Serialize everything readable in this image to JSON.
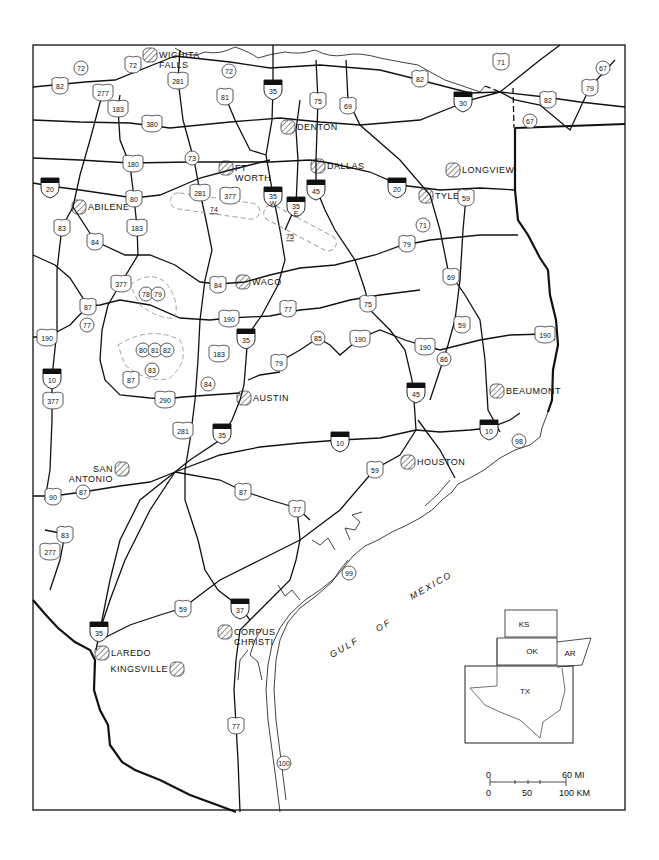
{
  "map": {
    "title": "",
    "water_label": [
      "GULF",
      "OF",
      "MEXICO"
    ],
    "cities": [
      {
        "name": "WICHITA",
        "name2": "FALLS",
        "x": 150,
        "y": 55
      },
      {
        "name": "DENTON",
        "x": 288,
        "y": 127
      },
      {
        "name": "DALLAS",
        "x": 318,
        "y": 166
      },
      {
        "name": "FT",
        "name2": "WORTH",
        "x": 226,
        "y": 168
      },
      {
        "name": "ABILENE",
        "x": 79,
        "y": 207
      },
      {
        "name": "LONGVIEW",
        "x": 453,
        "y": 170
      },
      {
        "name": "TYLER",
        "x": 426,
        "y": 196
      },
      {
        "name": "WACO",
        "x": 243,
        "y": 282
      },
      {
        "name": "AUSTIN",
        "x": 244,
        "y": 398
      },
      {
        "name": "BEAUMONT",
        "x": 497,
        "y": 391
      },
      {
        "name": "HOUSTON",
        "x": 408,
        "y": 462
      },
      {
        "name": "SAN",
        "name2": "ANTONIO",
        "x": 122,
        "y": 469
      },
      {
        "name": "CORPUS",
        "name2": "CHRISTI",
        "x": 225,
        "y": 632
      },
      {
        "name": "LAREDO",
        "x": 102,
        "y": 653
      },
      {
        "name": "KINGSVILLE",
        "x": 177,
        "y": 669
      }
    ],
    "interstates": [
      {
        "num": "35",
        "x": 273,
        "y": 88
      },
      {
        "num": "30",
        "x": 463,
        "y": 100
      },
      {
        "num": "20",
        "x": 50,
        "y": 186
      },
      {
        "num": "20",
        "x": 397,
        "y": 186
      },
      {
        "num": "35",
        "sub": "W",
        "x": 273,
        "y": 195
      },
      {
        "num": "35",
        "sub": "E",
        "x": 296,
        "y": 205
      },
      {
        "num": "45",
        "x": 316,
        "y": 188
      },
      {
        "num": "35",
        "x": 246,
        "y": 337
      },
      {
        "num": "10",
        "x": 52,
        "y": 377
      },
      {
        "num": "45",
        "x": 416,
        "y": 391
      },
      {
        "num": "35",
        "x": 222,
        "y": 432
      },
      {
        "num": "10",
        "x": 340,
        "y": 440
      },
      {
        "num": "10",
        "x": 489,
        "y": 428
      },
      {
        "num": "35",
        "x": 99,
        "y": 630
      },
      {
        "num": "37",
        "x": 240,
        "y": 607
      }
    ],
    "us_routes": [
      {
        "num": "82",
        "x": 60,
        "y": 85
      },
      {
        "num": "277",
        "x": 103,
        "y": 92
      },
      {
        "num": "72",
        "x": 133,
        "y": 64
      },
      {
        "num": "281",
        "x": 178,
        "y": 80
      },
      {
        "num": "183",
        "x": 118,
        "y": 108
      },
      {
        "num": "380",
        "x": 152,
        "y": 123
      },
      {
        "num": "81",
        "x": 225,
        "y": 96
      },
      {
        "num": "75",
        "x": 318,
        "y": 100
      },
      {
        "num": "69",
        "x": 348,
        "y": 105
      },
      {
        "num": "82",
        "x": 420,
        "y": 78
      },
      {
        "num": "71",
        "x": 501,
        "y": 61
      },
      {
        "num": "82",
        "x": 548,
        "y": 99
      },
      {
        "num": "79",
        "x": 590,
        "y": 87
      },
      {
        "num": "180",
        "x": 133,
        "y": 163
      },
      {
        "num": "80",
        "x": 134,
        "y": 198
      },
      {
        "num": "281",
        "x": 200,
        "y": 192
      },
      {
        "num": "377",
        "x": 230,
        "y": 195
      },
      {
        "num": "83",
        "x": 62,
        "y": 227
      },
      {
        "num": "84",
        "x": 95,
        "y": 241
      },
      {
        "num": "183",
        "x": 137,
        "y": 227
      },
      {
        "num": "59",
        "x": 466,
        "y": 197
      },
      {
        "num": "79",
        "x": 407,
        "y": 243
      },
      {
        "num": "69",
        "x": 451,
        "y": 276
      },
      {
        "num": "377",
        "x": 121,
        "y": 283
      },
      {
        "num": "84",
        "x": 218,
        "y": 284
      },
      {
        "num": "87",
        "x": 88,
        "y": 306
      },
      {
        "num": "77",
        "x": 288,
        "y": 308
      },
      {
        "num": "75",
        "x": 368,
        "y": 303
      },
      {
        "num": "190",
        "x": 47,
        "y": 337
      },
      {
        "num": "190",
        "x": 229,
        "y": 318
      },
      {
        "num": "59",
        "x": 462,
        "y": 324
      },
      {
        "num": "190",
        "x": 360,
        "y": 338
      },
      {
        "num": "190",
        "x": 425,
        "y": 346
      },
      {
        "num": "190",
        "x": 545,
        "y": 334
      },
      {
        "num": "183",
        "x": 219,
        "y": 353
      },
      {
        "num": "79",
        "x": 279,
        "y": 362
      },
      {
        "num": "87",
        "x": 131,
        "y": 379
      },
      {
        "num": "377",
        "x": 53,
        "y": 400
      },
      {
        "num": "290",
        "x": 165,
        "y": 399
      },
      {
        "num": "281",
        "x": 183,
        "y": 430
      },
      {
        "num": "59",
        "x": 375,
        "y": 469
      },
      {
        "num": "87",
        "x": 243,
        "y": 491
      },
      {
        "num": "77",
        "x": 297,
        "y": 508
      },
      {
        "num": "90",
        "x": 53,
        "y": 496
      },
      {
        "num": "83",
        "x": 65,
        "y": 534
      },
      {
        "num": "277",
        "x": 50,
        "y": 551
      },
      {
        "num": "59",
        "x": 183,
        "y": 608
      },
      {
        "num": "77",
        "x": 236,
        "y": 725
      }
    ],
    "state_routes": [
      {
        "num": "72",
        "x": 81,
        "y": 68
      },
      {
        "num": "72",
        "x": 229,
        "y": 71
      },
      {
        "num": "67",
        "x": 603,
        "y": 68
      },
      {
        "num": "67",
        "x": 530,
        "y": 121
      },
      {
        "num": "73",
        "x": 192,
        "y": 158
      },
      {
        "num": "71",
        "x": 423,
        "y": 225
      },
      {
        "num": "78",
        "x": 146,
        "y": 294
      },
      {
        "num": "79",
        "x": 158,
        "y": 294
      },
      {
        "num": "77",
        "x": 87,
        "y": 325
      },
      {
        "num": "80",
        "x": 143,
        "y": 350
      },
      {
        "num": "81",
        "x": 155,
        "y": 350
      },
      {
        "num": "82",
        "x": 167,
        "y": 350
      },
      {
        "num": "83",
        "x": 152,
        "y": 370
      },
      {
        "num": "84",
        "x": 208,
        "y": 384
      },
      {
        "num": "85",
        "x": 318,
        "y": 338
      },
      {
        "num": "86",
        "x": 444,
        "y": 359
      },
      {
        "num": "87",
        "x": 83,
        "y": 492
      },
      {
        "num": "98",
        "x": 519,
        "y": 441
      },
      {
        "num": "99",
        "x": 349,
        "y": 573
      },
      {
        "num": "100",
        "x": 284,
        "y": 763
      }
    ],
    "dashed_zones": [
      {
        "label": "74",
        "x": 214,
        "y": 209
      },
      {
        "label": "75",
        "x": 290,
        "y": 236
      }
    ],
    "inset": {
      "states": [
        "KS",
        "OK",
        "AR",
        "TX"
      ]
    },
    "scale": {
      "mi_labels": [
        "0",
        "60 MI"
      ],
      "km_labels": [
        "0",
        "50",
        "100 KM"
      ]
    }
  }
}
